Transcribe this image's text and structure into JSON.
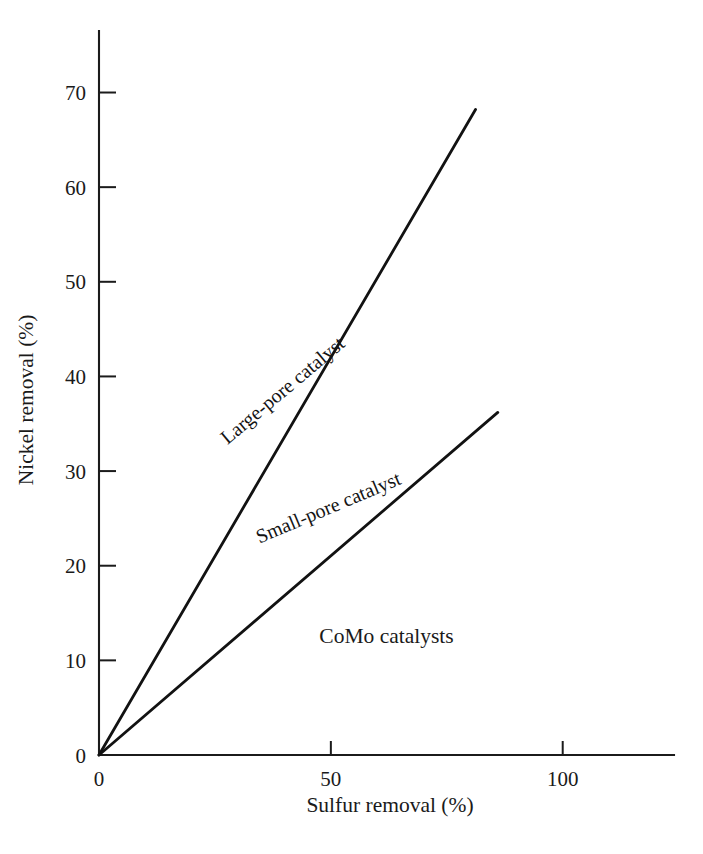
{
  "chart_data": {
    "type": "line",
    "title": "",
    "subtitle": "",
    "xlabel": "Sulfur removal (%)",
    "ylabel": "Nickel removal (%)",
    "xlim": [
      0,
      124
    ],
    "ylim": [
      0,
      76.5
    ],
    "grid": false,
    "legend_position": "inline-annotations",
    "x_ticks": [
      {
        "value": 0,
        "label": "0"
      },
      {
        "value": 50,
        "label": "50"
      },
      {
        "value": 100,
        "label": "100"
      }
    ],
    "y_ticks": [
      {
        "value": 0,
        "label": "0"
      },
      {
        "value": 10,
        "label": "10"
      },
      {
        "value": 20,
        "label": "20"
      },
      {
        "value": 30,
        "label": "30"
      },
      {
        "value": 40,
        "label": "40"
      },
      {
        "value": 50,
        "label": "50"
      },
      {
        "value": 60,
        "label": "60"
      },
      {
        "value": 70,
        "label": "70"
      }
    ],
    "series": [
      {
        "name": "Large-pore catalyst",
        "x": [
          0,
          81.2
        ],
        "y": [
          0,
          68.2
        ],
        "label_x": 40.5,
        "label_y": 38.0,
        "label_rotation": -40.0
      },
      {
        "name": "Small-pore catalyst",
        "x": [
          0,
          86.0
        ],
        "y": [
          0,
          36.2
        ],
        "label_x": 50.0,
        "label_y": 25.5,
        "label_rotation": -22.8
      }
    ],
    "annotations": [
      {
        "text": "CoMo catalysts",
        "x": 62.0,
        "y": 11.8
      }
    ]
  }
}
